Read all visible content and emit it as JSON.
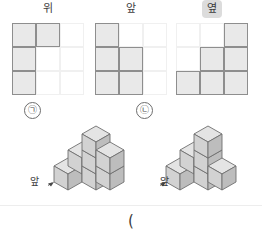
{
  "views": {
    "items": [
      {
        "label": "위",
        "highlighted": false,
        "name": "top-view",
        "grid": [
          [
            1,
            1,
            0
          ],
          [
            1,
            0,
            0
          ],
          [
            1,
            0,
            0
          ]
        ]
      },
      {
        "label": "앞",
        "highlighted": false,
        "name": "front-view",
        "grid": [
          [
            1,
            0,
            0
          ],
          [
            1,
            1,
            0
          ],
          [
            1,
            1,
            0
          ]
        ]
      },
      {
        "label": "옆",
        "highlighted": true,
        "name": "side-view",
        "grid": [
          [
            0,
            0,
            1
          ],
          [
            0,
            1,
            1
          ],
          [
            1,
            1,
            1
          ]
        ]
      }
    ]
  },
  "figures": {
    "items": [
      {
        "tag": "㉠",
        "front_label": "앞",
        "name": "figure-a"
      },
      {
        "tag": "㉡",
        "front_label": "앞",
        "name": "figure-b"
      }
    ]
  },
  "answer": {
    "paren": "("
  },
  "colors": {
    "cell_fill": "#e9e9e9",
    "cell_border": "#8e8e8e",
    "grid_faint": "#f0f0f0",
    "highlight_bg": "#dcdcdc",
    "cube_top": "#e4e4e4",
    "cube_left": "#d2d2d2",
    "cube_right": "#bdbdbd",
    "cube_edge": "#6f6f6f"
  }
}
